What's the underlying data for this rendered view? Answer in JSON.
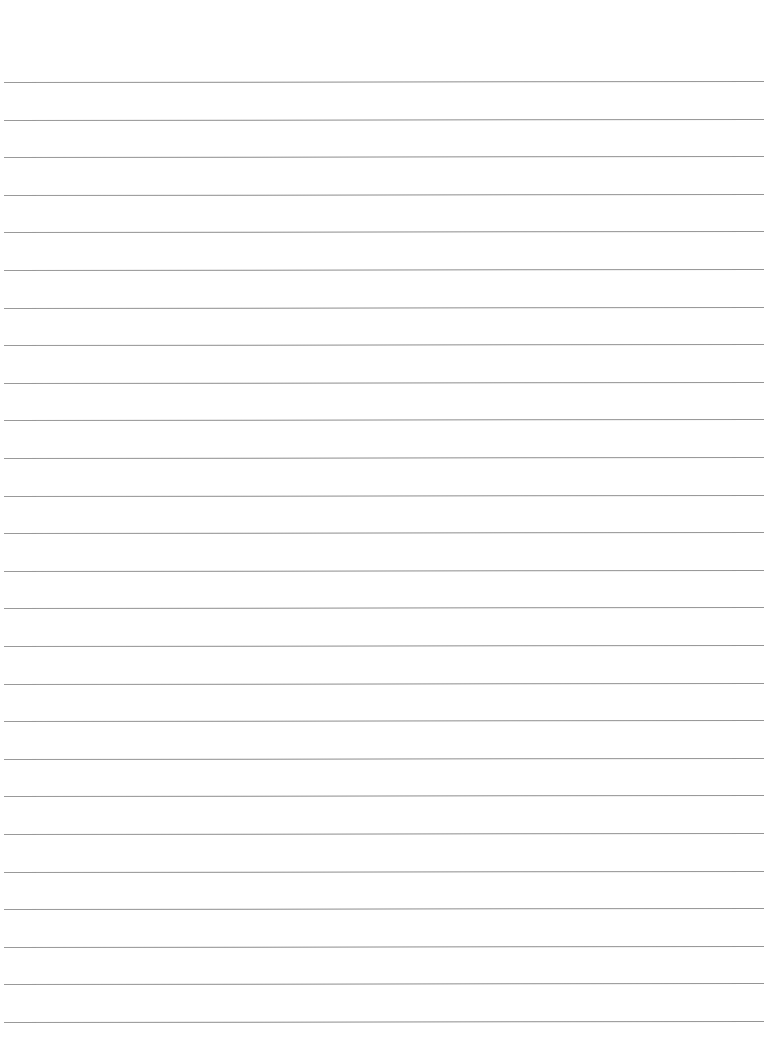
{
  "page": {
    "type": "lined-paper",
    "background_color": "#ffffff",
    "line_color": "#8e8e8e",
    "line_count": 26,
    "first_line_y": 82,
    "line_spacing": 37.6,
    "line_left": 4,
    "line_width": 760
  }
}
